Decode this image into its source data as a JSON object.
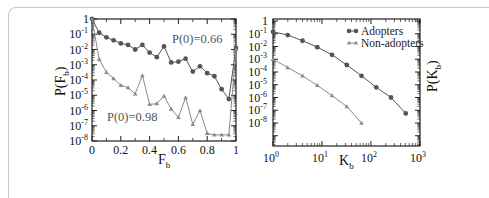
{
  "chart_data": [
    {
      "type": "line",
      "panel": "left",
      "xlabel": "F_b",
      "ylabel": "P(F_b)",
      "xscale": "linear",
      "yscale": "log",
      "xlim": [
        0,
        1
      ],
      "ylim": [
        1e-08,
        1
      ],
      "x_ticks": [
        "0",
        "0.2",
        "0.4",
        "0.6",
        "0.8",
        "1"
      ],
      "y_ticks": [
        "1",
        "10^-1",
        "10^-2",
        "10^-3",
        "10^-4",
        "10^-5",
        "10^-6",
        "10^-7",
        "10^-8"
      ],
      "annotations": [
        {
          "text": "P(0)=0.66",
          "series": "Adopters"
        },
        {
          "text": "P(0)=0.98",
          "series": "Non-adopters"
        }
      ],
      "x": [
        0,
        0.05,
        0.1,
        0.15,
        0.2,
        0.25,
        0.3,
        0.35,
        0.4,
        0.45,
        0.5,
        0.55,
        0.6,
        0.65,
        0.7,
        0.75,
        0.8,
        0.85,
        0.9,
        0.95,
        1.0
      ],
      "series": [
        {
          "name": "Adopters",
          "marker": "circle",
          "color": "#555555",
          "log10_values": [
            0,
            -0.9,
            -1.2,
            -1.4,
            -1.6,
            -1.7,
            -2.0,
            -1.7,
            -2.2,
            -2.5,
            -1.8,
            -2.85,
            -2.8,
            -2.6,
            -3.45,
            -3.1,
            -3.55,
            -3.75,
            -4.6,
            -5.25,
            -1.9
          ]
        },
        {
          "name": "Non-adopters",
          "marker": "triangle",
          "color": "#8a8a8a",
          "log10_values": [
            0,
            -2.65,
            -3.5,
            -3.9,
            -4.35,
            -4.5,
            -4.9,
            -3.7,
            -5.6,
            -5.55,
            -5.05,
            -5.9,
            -6.45,
            -5.15,
            -6.9,
            -6.0,
            -7.5,
            -7.6,
            -7.6,
            -7.6,
            -2.0
          ]
        }
      ],
      "grid": false
    },
    {
      "type": "line",
      "panel": "right",
      "xlabel": "K_b",
      "ylabel": "P(K_b)",
      "xscale": "log",
      "yscale": "log",
      "xlim": [
        1,
        1000
      ],
      "ylim": [
        1e-10,
        1
      ],
      "x_ticks": [
        "10^0",
        "10^1",
        "10^2",
        "10^3"
      ],
      "y_ticks": [
        "1",
        "10^-1",
        "10^-2",
        "10^-3",
        "10^-4",
        "10^-5",
        "10^-6",
        "10^-7",
        "10^-8"
      ],
      "legend": {
        "position": "upper right",
        "entries": [
          "Adopters",
          "Non-adopters"
        ]
      },
      "series": [
        {
          "name": "Adopters",
          "marker": "circle",
          "color": "#555555",
          "x": [
            1,
            2,
            4,
            8,
            16,
            32,
            64,
            128,
            256,
            512
          ],
          "log10_values": [
            -0.85,
            -1.1,
            -1.55,
            -2.05,
            -2.65,
            -3.45,
            -4.3,
            -5.2,
            -6.0,
            -7.25
          ]
        },
        {
          "name": "Non-adopters",
          "marker": "triangle",
          "color": "#8a8a8a",
          "x": [
            1,
            2,
            4,
            8,
            16,
            32,
            64
          ],
          "log10_values": [
            -3.0,
            -3.65,
            -4.3,
            -5.05,
            -5.85,
            -6.7,
            -8.0
          ]
        }
      ],
      "grid": false
    }
  ],
  "labels": {
    "left_xlabel": "F",
    "left_xlabel_sub": "b",
    "left_ylabel": "P(F",
    "left_ylabel_sub": "b",
    "left_ylabel_close": ")",
    "right_xlabel": "K",
    "right_xlabel_sub": "b",
    "right_ylabel": "P(K",
    "right_ylabel_sub": "b",
    "right_ylabel_close": ")",
    "annot_adopters": "P(0)=0.66",
    "annot_nonadopters": "P(0)=0.98",
    "legend_adopters": "Adopters",
    "legend_nonadopters": "Non-adopters"
  }
}
